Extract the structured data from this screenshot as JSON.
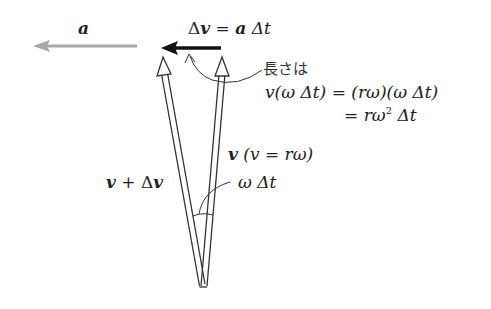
{
  "labels": {
    "a": "a",
    "dv_delta": "Δ",
    "dv_v": "v",
    "dv_eq": " = ",
    "dv_a": "a",
    "dv_dt": " Δt",
    "length_jp": "長さは",
    "eq1_lhs": "v(ω Δt) = (rω)(ω Δt)",
    "eq2_eq": "= ",
    "eq2_r": "rω",
    "eq2_sup": "2",
    "eq2_dt": " Δt",
    "v_bold": "v",
    "v_paren": " (v = rω)",
    "vdv_v1": "v",
    "vdv_plus": " + Δ",
    "vdv_v2": "v",
    "angle": "ω Δt"
  },
  "colors": {
    "accel_arrow": "#a8a8a8",
    "delta_v_arrow": "#111111",
    "velocity_arrows": "#333333",
    "text": "#222222"
  },
  "geometry": {
    "vertex": [
      203,
      287
    ],
    "v_tip": [
      222,
      57
    ],
    "v_plus_dv_tip": [
      163,
      57
    ],
    "delta_v_arrow": {
      "from": [
        221,
        48
      ],
      "to": [
        161,
        48
      ]
    },
    "a_arrow": {
      "from": [
        137,
        46
      ],
      "to": [
        33,
        46
      ]
    }
  }
}
